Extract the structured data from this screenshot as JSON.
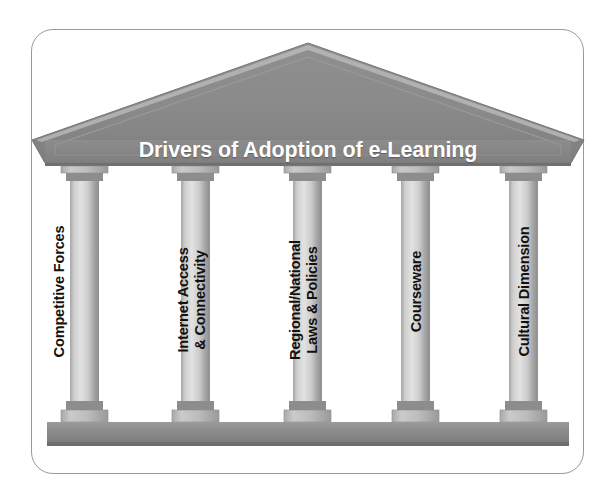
{
  "figure": {
    "type": "greek-temple-pillars-diagram",
    "title": "Drivers of Adoption of e-Learning",
    "background_color": "#ffffff",
    "frame_border_color": "#9a9a9a",
    "roof_color": "#8a8a8a",
    "roof_dark_color": "#6f6f6f",
    "entablature_color": "#8a8a8a",
    "column_light_color": "#d8d8d8",
    "column_dark_color": "#9b9b9b",
    "floor_color": "#8d8d8d",
    "floor_dark_color": "#6e6e6e",
    "title_color": "#ffffff",
    "label_color": "#111111"
  },
  "pillars": [
    {
      "id": "competitive-forces",
      "line1": "Competitive Forces",
      "line2": ""
    },
    {
      "id": "internet-access-connectivity",
      "line1": "Internet Access",
      "line2": "& Connectivity"
    },
    {
      "id": "regional-national-laws-policies",
      "line1": "Regional/National",
      "line2": "Laws & Policies"
    },
    {
      "id": "courseware",
      "line1": "Courseware",
      "line2": ""
    },
    {
      "id": "cultural-dimension",
      "line1": "Cultural Dimension",
      "line2": ""
    }
  ]
}
